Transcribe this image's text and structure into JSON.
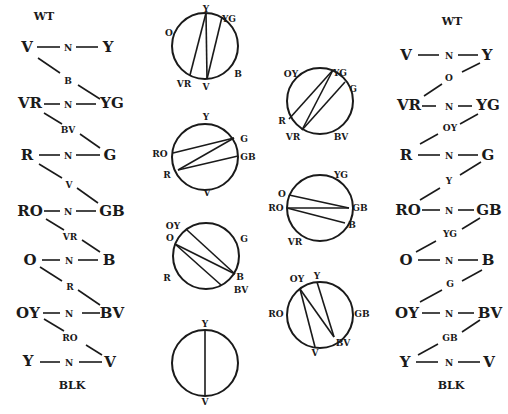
{
  "left_ladder": {
    "top": "WT",
    "bottom": "BLK",
    "rows": [
      {
        "left": "V",
        "mid": "N",
        "right": "Y"
      },
      {
        "left": "VR",
        "mid": "N",
        "right": "YG"
      },
      {
        "left": "R",
        "mid": "N",
        "right": "G"
      },
      {
        "left": "RO",
        "mid": "N",
        "right": "GB"
      },
      {
        "left": "O",
        "mid": "N",
        "right": "B"
      },
      {
        "left": "OY",
        "mid": "N",
        "right": "BV"
      },
      {
        "left": "Y",
        "mid": "N",
        "right": "V"
      }
    ],
    "links": [
      "B",
      "BV",
      "V",
      "VR",
      "R",
      "RO"
    ]
  },
  "right_ladder": {
    "top": "WT",
    "bottom": "BLK",
    "rows": [
      {
        "left": "V",
        "mid": "N",
        "right": "Y"
      },
      {
        "left": "VR",
        "mid": "N",
        "right": "YG"
      },
      {
        "left": "R",
        "mid": "N",
        "right": "G"
      },
      {
        "left": "RO",
        "mid": "N",
        "right": "GB"
      },
      {
        "left": "O",
        "mid": "N",
        "right": "B"
      },
      {
        "left": "OY",
        "mid": "N",
        "right": "BV"
      },
      {
        "left": "Y",
        "mid": "N",
        "right": "V"
      }
    ],
    "links": [
      "O",
      "OY",
      "Y",
      "YG",
      "G",
      "GB"
    ]
  },
  "circles": {
    "c1": {
      "labels": [
        "O",
        "Y",
        "YG",
        "VR",
        "V",
        "B"
      ]
    },
    "c2": {
      "labels": [
        "Y",
        "G",
        "RO",
        "GB",
        "R",
        "V"
      ]
    },
    "c3": {
      "labels": [
        "OY",
        "O",
        "G",
        "R",
        "B",
        "BV"
      ]
    },
    "c4": {
      "labels": [
        "Y",
        "V"
      ]
    },
    "c5": {
      "labels": [
        "OY",
        "YG",
        "G",
        "R",
        "VR",
        "BV"
      ]
    },
    "c6": {
      "labels": [
        "YG",
        "O",
        "RO",
        "GB",
        "B",
        "VR"
      ]
    },
    "c7": {
      "labels": [
        "OY",
        "Y",
        "RO",
        "GB",
        "V",
        "BV"
      ]
    }
  }
}
